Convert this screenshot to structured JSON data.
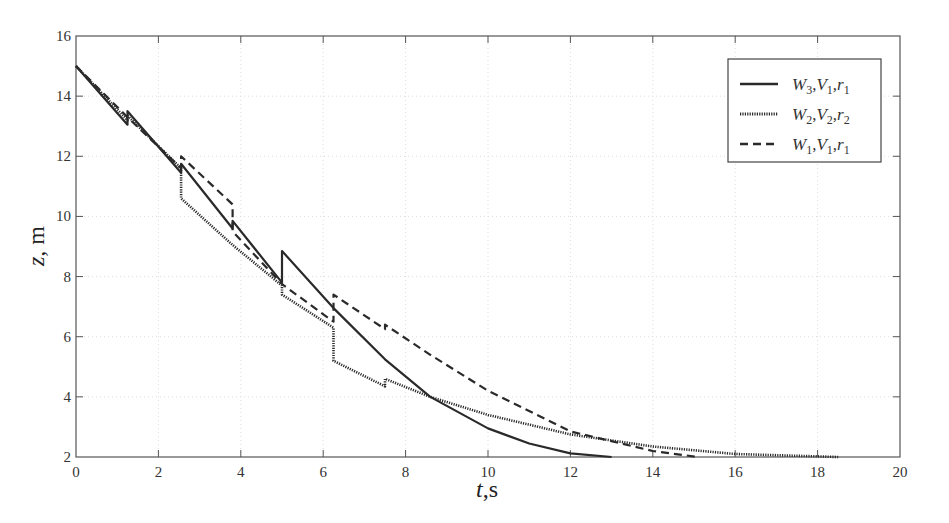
{
  "chart_data": {
    "type": "line",
    "title": "",
    "xlabel": "t,s",
    "ylabel": "z, m",
    "xlim": [
      0,
      20
    ],
    "ylim": [
      2,
      16
    ],
    "xticks": [
      0,
      2,
      4,
      6,
      8,
      10,
      12,
      14,
      16,
      18,
      20
    ],
    "yticks": [
      2,
      4,
      6,
      8,
      10,
      12,
      14,
      16
    ],
    "grid": true,
    "legend_position": "upper right",
    "series": [
      {
        "name": "W3,V1,r1",
        "style": "solid",
        "x": [
          0,
          1.25,
          1.25,
          2.55,
          2.55,
          3.8,
          3.8,
          5.0,
          5.0,
          6.25,
          7.5,
          8.6,
          10,
          11,
          12,
          13.0
        ],
        "y": [
          15,
          13.05,
          13.5,
          11.45,
          11.75,
          9.6,
          9.85,
          7.8,
          8.85,
          6.95,
          5.25,
          4.0,
          2.95,
          2.45,
          2.12,
          2.0
        ]
      },
      {
        "name": "W2,V2,r2",
        "style": "dotted",
        "x": [
          0,
          1.25,
          1.25,
          2.55,
          2.55,
          3.8,
          5.0,
          5.0,
          6.25,
          6.25,
          7.5,
          7.5,
          8.6,
          10,
          12,
          14,
          16,
          18.5
        ],
        "y": [
          15,
          13.2,
          13.35,
          11.6,
          10.6,
          9.05,
          7.7,
          7.4,
          6.3,
          5.2,
          4.35,
          4.6,
          4.0,
          3.4,
          2.75,
          2.35,
          2.1,
          2.0
        ]
      },
      {
        "name": "W1,V1,r1",
        "style": "dashed",
        "x": [
          0,
          1.25,
          2.55,
          2.55,
          3.8,
          3.8,
          5.0,
          6.25,
          6.25,
          7.5,
          7.5,
          8.6,
          10,
          12,
          14,
          15.1
        ],
        "y": [
          15,
          13.3,
          11.6,
          12.0,
          10.4,
          9.5,
          7.75,
          6.5,
          7.4,
          6.25,
          6.4,
          5.4,
          4.2,
          2.85,
          2.2,
          2.0
        ]
      }
    ]
  },
  "legend": {
    "items": [
      {
        "w": "W",
        "ws": "3",
        "v": "V",
        "vs": "1",
        "r": "r",
        "rs": "1",
        "style": "solid"
      },
      {
        "w": "W",
        "ws": "2",
        "v": "V",
        "vs": "2",
        "r": "r",
        "rs": "2",
        "style": "dotted"
      },
      {
        "w": "W",
        "ws": "1",
        "v": "V",
        "vs": "1",
        "r": "r",
        "rs": "1",
        "style": "dashed"
      }
    ]
  },
  "axes": {
    "x_label_var": "t",
    "x_label_unit": ",s",
    "y_label_var": "z",
    "y_label_unit": ", m"
  }
}
